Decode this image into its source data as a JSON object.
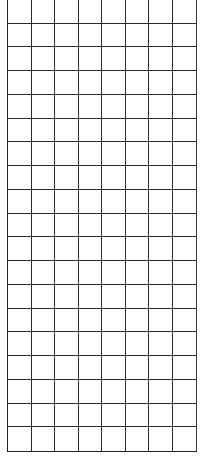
{
  "grid": {
    "columns": 8,
    "rows": 19,
    "line_color": "#2a2a2a",
    "background": "#ffffff",
    "cells_content": "empty"
  }
}
